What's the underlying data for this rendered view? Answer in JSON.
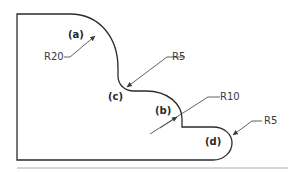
{
  "diagram": {
    "type": "technical-profile-drawing",
    "outline_color": "#2b2b2b",
    "leader_color": "#3a3a3a",
    "rule_color": "#c8c8c8",
    "features": [
      {
        "id": "a",
        "letter": "(a)",
        "radius_label": "R20"
      },
      {
        "id": "c",
        "letter": "(c)",
        "radius_label": "R5"
      },
      {
        "id": "b",
        "letter": "(b)",
        "radius_label": "R10"
      },
      {
        "id": "d",
        "letter": "(d)",
        "radius_label": "R5"
      }
    ]
  }
}
